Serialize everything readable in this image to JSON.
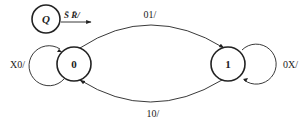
{
  "diagram": {
    "type": "state-transition",
    "initial_marker": {
      "label": "Q",
      "condition": "S̄ R̄/"
    },
    "states": [
      {
        "id": "0",
        "label": "0"
      },
      {
        "id": "1",
        "label": "1"
      }
    ],
    "transitions": [
      {
        "from": "0",
        "to": "1",
        "label": "01/"
      },
      {
        "from": "1",
        "to": "0",
        "label": "10/"
      },
      {
        "from": "0",
        "to": "0",
        "label": "X0/"
      },
      {
        "from": "1",
        "to": "1",
        "label": "0X/"
      }
    ],
    "colors": {
      "stroke": "#222222",
      "background": "#ffffff"
    }
  }
}
